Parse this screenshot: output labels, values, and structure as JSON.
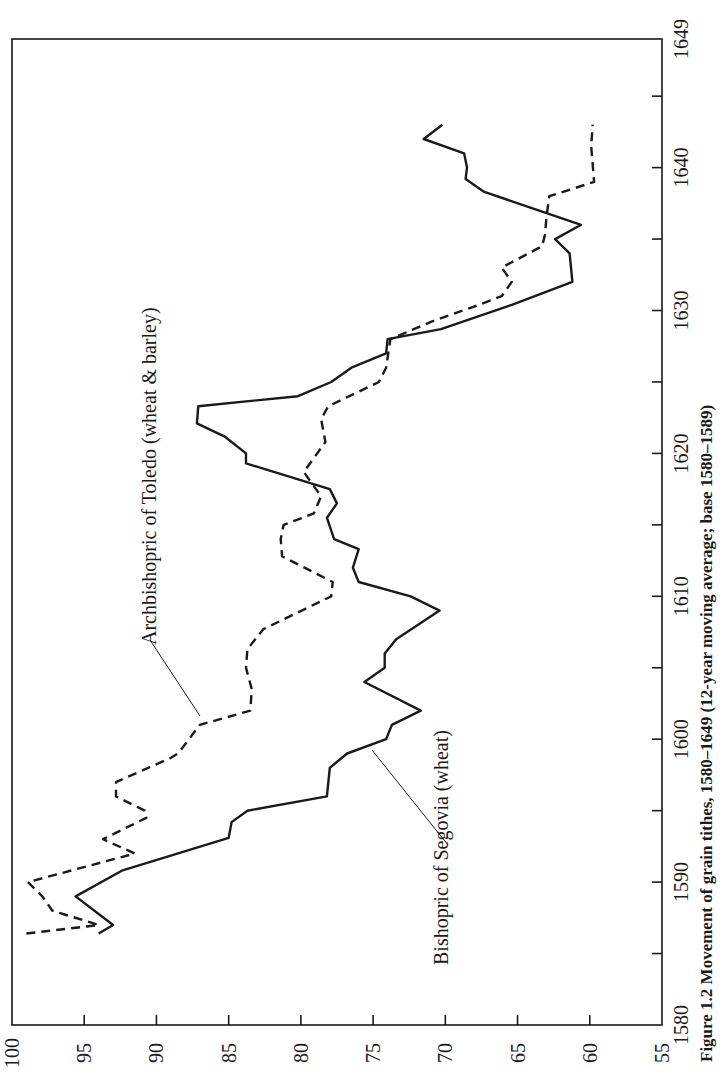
{
  "caption": "Figure 1.2 Movement of grain tithes, 1580–1649 (12-year moving average; base 1580–1589)",
  "chart_data": {
    "type": "line",
    "orientation": "rotated 90° counter-clockwise on page (years run bottom-to-top along right edge)",
    "title": "Movement of grain tithes, 1580–1649",
    "xlabel": "Year",
    "ylabel": "Index",
    "xlim": [
      1580,
      1649
    ],
    "ylim": [
      55,
      100
    ],
    "xticks": [
      1580,
      1590,
      1600,
      1610,
      1620,
      1630,
      1640,
      1649
    ],
    "xticks_minor": [
      1585,
      1595,
      1605,
      1615,
      1625,
      1635,
      1645
    ],
    "yticks": [
      100,
      95,
      90,
      85,
      80,
      75,
      70,
      65,
      60,
      55
    ],
    "grid": false,
    "legend": "inline labels with leader lines",
    "series": [
      {
        "name": "Archbishopric of Toledo (wheat & barley)",
        "style": "dashed",
        "color": "#1a1a1a",
        "points": [
          [
            1586.4,
            99
          ],
          [
            1587,
            94
          ],
          [
            1588,
            97.2
          ],
          [
            1589,
            97.9
          ],
          [
            1590,
            98.9
          ],
          [
            1592,
            91.5
          ],
          [
            1593,
            93.7
          ],
          [
            1594.5,
            90.7
          ],
          [
            1595,
            90.8
          ],
          [
            1596,
            92.8
          ],
          [
            1597,
            92.8
          ],
          [
            1598.7,
            89
          ],
          [
            1599,
            88.5
          ],
          [
            1601,
            87
          ],
          [
            1602,
            83.5
          ],
          [
            1603.5,
            83.4
          ],
          [
            1605,
            83.8
          ],
          [
            1606.3,
            83.7
          ],
          [
            1607.7,
            82.6
          ],
          [
            1610,
            77.9
          ],
          [
            1611,
            77.8
          ],
          [
            1612.8,
            81.3
          ],
          [
            1614,
            81.4
          ],
          [
            1615,
            81.2
          ],
          [
            1615.8,
            79.1
          ],
          [
            1617,
            78.6
          ],
          [
            1618.7,
            79.8
          ],
          [
            1620.8,
            78.3
          ],
          [
            1622.4,
            78.6
          ],
          [
            1623.3,
            78.1
          ],
          [
            1625,
            74.6
          ],
          [
            1626,
            74.1
          ],
          [
            1628,
            73.8
          ],
          [
            1629.2,
            71
          ],
          [
            1630.2,
            68.2
          ],
          [
            1631,
            66.1
          ],
          [
            1632,
            65.4
          ],
          [
            1633,
            66.1
          ],
          [
            1634.5,
            63.3
          ],
          [
            1635.3,
            63.1
          ],
          [
            1636.5,
            63
          ],
          [
            1638,
            62.8
          ],
          [
            1639,
            59.7
          ],
          [
            1641.5,
            59.9
          ],
          [
            1643,
            59.8
          ]
        ]
      },
      {
        "name": "Bishopric of Segovia (wheat)",
        "style": "solid",
        "color": "#1a1a1a",
        "points": [
          [
            1586.4,
            94
          ],
          [
            1587,
            93
          ],
          [
            1589,
            95.6
          ],
          [
            1590.8,
            92.4
          ],
          [
            1593.1,
            85
          ],
          [
            1594.2,
            84.8
          ],
          [
            1595,
            83.7
          ],
          [
            1596,
            78.2
          ],
          [
            1598,
            78
          ],
          [
            1599,
            76.8
          ],
          [
            1600,
            74.1
          ],
          [
            1601,
            73.7
          ],
          [
            1602,
            71.7
          ],
          [
            1604,
            75.6
          ],
          [
            1605,
            74.2
          ],
          [
            1606,
            74.2
          ],
          [
            1607,
            73.4
          ],
          [
            1609,
            70.4
          ],
          [
            1610,
            72.4
          ],
          [
            1611,
            76
          ],
          [
            1612,
            76.4
          ],
          [
            1613.3,
            76
          ],
          [
            1614,
            77.7
          ],
          [
            1615.5,
            78.2
          ],
          [
            1616.5,
            77.5
          ],
          [
            1617.5,
            78
          ],
          [
            1619.3,
            83.8
          ],
          [
            1620,
            83.8
          ],
          [
            1621.2,
            85.3
          ],
          [
            1622.1,
            87.2
          ],
          [
            1623.3,
            87.1
          ],
          [
            1624,
            80.2
          ],
          [
            1625,
            77.9
          ],
          [
            1626,
            76.5
          ],
          [
            1627,
            74.1
          ],
          [
            1628,
            74
          ],
          [
            1628.7,
            70.3
          ],
          [
            1630.4,
            65.4
          ],
          [
            1632,
            61.2
          ],
          [
            1634,
            61.4
          ],
          [
            1635,
            62.4
          ],
          [
            1636,
            60.6
          ],
          [
            1638.3,
            67.3
          ],
          [
            1639.2,
            68.6
          ],
          [
            1640,
            68.5
          ],
          [
            1641,
            68.7
          ],
          [
            1642,
            71.5
          ],
          [
            1643,
            70.2
          ]
        ]
      }
    ],
    "annotations": [
      {
        "text": "Archbishopric of Toledo (wheat & barley)",
        "series": 0,
        "leader_to": [
          1601,
          87
        ]
      },
      {
        "text": "Bishopric of Segovia (wheat)",
        "series": 1,
        "leader_to": [
          1599,
          76.8
        ]
      }
    ]
  }
}
